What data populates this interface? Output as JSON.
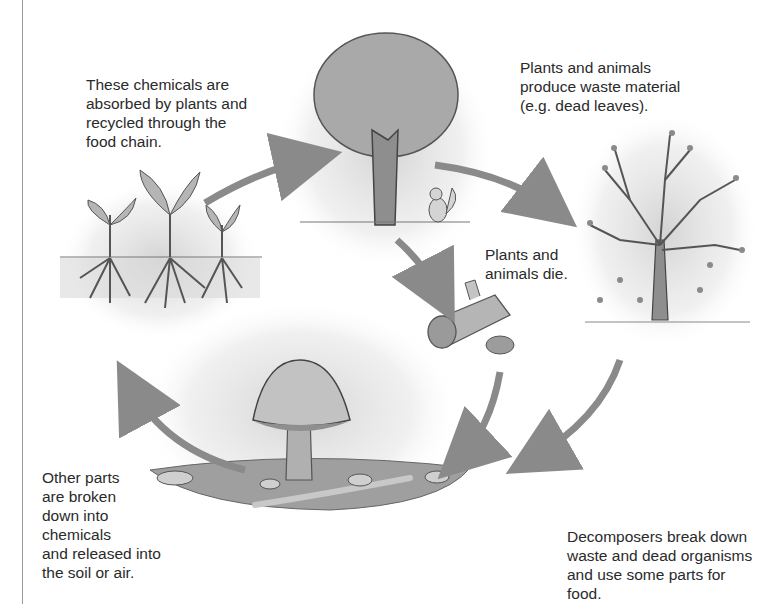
{
  "diagram": {
    "type": "cycle",
    "stages": [
      {
        "id": "tree",
        "illustration": "leafy-tree-with-squirrel"
      },
      {
        "id": "bare-tree",
        "illustration": "bare-tree-dropping-leaves"
      },
      {
        "id": "dead-organisms",
        "illustration": "fallen-log-and-dead-hedgehog"
      },
      {
        "id": "decomposers",
        "illustration": "mushroom-worms-woodlice-soil"
      },
      {
        "id": "seedlings",
        "illustration": "seedlings-with-roots"
      }
    ],
    "arrows": [
      {
        "from": "seedlings",
        "to": "tree"
      },
      {
        "from": "tree",
        "to": "bare-tree"
      },
      {
        "from": "tree",
        "to": "dead-organisms"
      },
      {
        "from": "dead-organisms",
        "to": "decomposers"
      },
      {
        "from": "bare-tree",
        "to": "decomposers"
      },
      {
        "from": "decomposers",
        "to": "seedlings"
      }
    ],
    "labels": {
      "absorbed": "These chemicals are\nabsorbed by plants and\nrecycled through the\nfood chain.",
      "waste": "Plants and animals\nproduce waste material\n(e.g. dead leaves).",
      "die": "Plants and\nanimals die.",
      "released": "Other parts\nare broken\ndown into\nchemicals\nand released into\nthe soil or air.",
      "decomposers": "Decomposers break down\nwaste and dead organisms\nand use some parts for food."
    }
  }
}
